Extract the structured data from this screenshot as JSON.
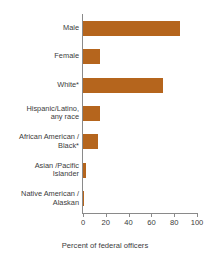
{
  "chart_data": {
    "type": "bar",
    "orientation": "horizontal",
    "title": "",
    "subtitle": "",
    "xlabel": "Percent of federal officers",
    "ylabel": "",
    "xlim": [
      0,
      100
    ],
    "xticks": [
      0,
      20,
      40,
      60,
      80,
      100
    ],
    "xtick_labels": [
      "0",
      "20",
      "40",
      "60",
      "80",
      "100"
    ],
    "grid": false,
    "legend": false,
    "bar_color": "#b5651d",
    "axis_color": "#8a8a8a",
    "text_color": "#3b3b3b",
    "categories": [
      "Male",
      "Female",
      "White*",
      "Hispanic/Latino,\nany race",
      "African American /\nBlack*",
      "Asian /Pacific\nIslander",
      "Native American /\nAlaskan"
    ],
    "values": [
      85,
      15,
      70,
      15,
      13,
      2.5,
      1
    ]
  }
}
